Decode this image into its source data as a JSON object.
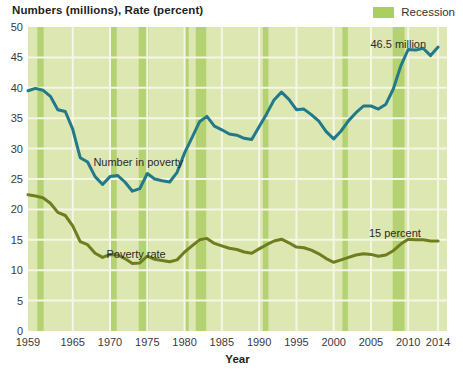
{
  "title": "Numbers (millions), Rate (percent)",
  "legend": {
    "label": "Recession",
    "swatch_color": "#a9cf5f"
  },
  "colors": {
    "plot_bg": "#dce7b1",
    "recession_band": "#b5d272",
    "gridline": "#f5f6e6",
    "number_line": "#21798a",
    "rate_line": "#6f7d1f",
    "title_text": "#1f1f1f",
    "tick_text": "#3a3a3a",
    "annotation_text": "#2b2b2b"
  },
  "chart_data": {
    "type": "line",
    "title": "Numbers (millions), Rate (percent)",
    "xlabel": "Year",
    "ylabel": "",
    "xlim": [
      1959,
      2015.2
    ],
    "ylim": [
      0,
      50
    ],
    "x_ticks": [
      1959,
      1965,
      1970,
      1975,
      1980,
      1985,
      1990,
      1995,
      2000,
      2005,
      2010,
      2014
    ],
    "y_ticks": [
      0,
      5,
      10,
      15,
      20,
      25,
      30,
      35,
      40,
      45,
      50
    ],
    "grid": true,
    "legend_position": "top-right",
    "years": [
      1959,
      1960,
      1961,
      1962,
      1963,
      1964,
      1965,
      1966,
      1967,
      1968,
      1969,
      1970,
      1971,
      1972,
      1973,
      1974,
      1975,
      1976,
      1977,
      1978,
      1979,
      1980,
      1981,
      1982,
      1983,
      1984,
      1985,
      1986,
      1987,
      1988,
      1989,
      1990,
      1991,
      1992,
      1993,
      1994,
      1995,
      1996,
      1997,
      1998,
      1999,
      2000,
      2001,
      2002,
      2003,
      2004,
      2005,
      2006,
      2007,
      2008,
      2009,
      2010,
      2011,
      2012,
      2013,
      2014
    ],
    "series": [
      {
        "name": "Number in poverty",
        "unit": "millions",
        "color": "#21798a",
        "values": [
          39.5,
          39.9,
          39.6,
          38.6,
          36.4,
          36.1,
          33.2,
          28.5,
          27.8,
          25.4,
          24.1,
          25.4,
          25.6,
          24.5,
          23.0,
          23.4,
          25.9,
          25.0,
          24.7,
          24.5,
          26.1,
          29.3,
          31.8,
          34.4,
          35.3,
          33.7,
          33.1,
          32.4,
          32.2,
          31.7,
          31.5,
          33.6,
          35.7,
          38.0,
          39.3,
          38.1,
          36.4,
          36.5,
          35.6,
          34.5,
          32.8,
          31.6,
          32.9,
          34.6,
          35.9,
          37.0,
          37.0,
          36.5,
          37.3,
          39.8,
          43.6,
          46.3,
          46.2,
          46.5,
          45.3,
          46.7
        ]
      },
      {
        "name": "Poverty rate",
        "unit": "percent",
        "color": "#6f7d1f",
        "values": [
          22.4,
          22.2,
          21.9,
          21.0,
          19.5,
          19.0,
          17.3,
          14.7,
          14.2,
          12.8,
          12.1,
          12.6,
          12.5,
          11.9,
          11.1,
          11.2,
          12.3,
          11.8,
          11.6,
          11.4,
          11.7,
          13.0,
          14.0,
          15.0,
          15.2,
          14.4,
          14.0,
          13.6,
          13.4,
          13.0,
          12.8,
          13.5,
          14.2,
          14.8,
          15.1,
          14.5,
          13.8,
          13.7,
          13.3,
          12.7,
          11.9,
          11.3,
          11.7,
          12.1,
          12.5,
          12.7,
          12.6,
          12.3,
          12.5,
          13.2,
          14.3,
          15.1,
          15.0,
          15.0,
          14.8,
          14.8
        ]
      }
    ],
    "recessions": [
      [
        1960.25,
        1961.1
      ],
      [
        1969.9,
        1970.9
      ],
      [
        1973.85,
        1975.2
      ],
      [
        1980.0,
        1980.55
      ],
      [
        1981.5,
        1982.9
      ],
      [
        1990.5,
        1991.25
      ],
      [
        2001.17,
        2001.9
      ],
      [
        2007.92,
        2009.5
      ]
    ],
    "annotations": [
      {
        "text": "Number in poverty",
        "year": 1973.8,
        "value": 27.2,
        "anchor": "middle"
      },
      {
        "text": "Poverty rate",
        "year": 1973.5,
        "value": 12.0,
        "anchor": "middle"
      },
      {
        "text": "46.5 million",
        "year": 2012.4,
        "value": 46.6,
        "anchor": "end"
      },
      {
        "text": "15 percent",
        "year": 2011.7,
        "value": 15.4,
        "anchor": "end"
      }
    ]
  }
}
